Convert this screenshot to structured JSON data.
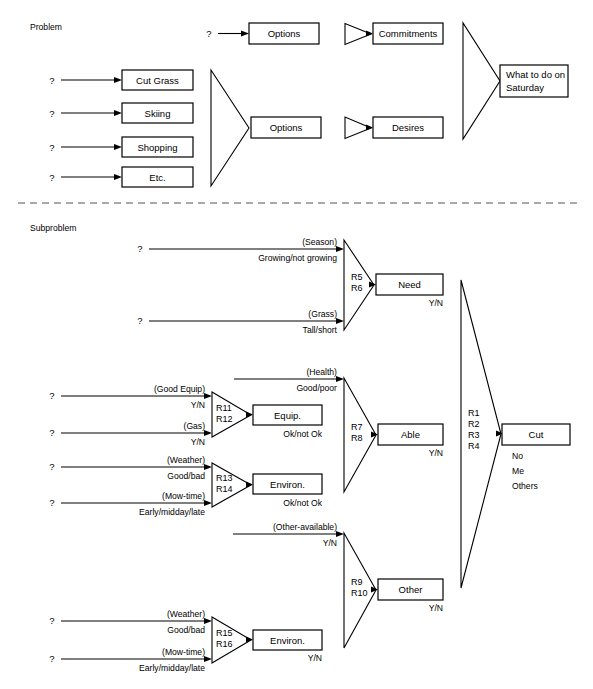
{
  "figure": {
    "sections": [
      {
        "id": "problem",
        "label": "Problem"
      },
      {
        "id": "subproblem",
        "label": "Subproblem"
      }
    ],
    "divider": "dashed-horizontal-separator"
  },
  "problem": {
    "label": "Problem",
    "unknown_marker": "?",
    "top_row": {
      "input_marker": "?",
      "options_box": "Options",
      "commitments_box": "Commitments"
    },
    "option_boxes": [
      {
        "marker": "?",
        "label": "Cut Grass"
      },
      {
        "marker": "?",
        "label": "Skiing"
      },
      {
        "marker": "?",
        "label": "Shopping"
      },
      {
        "marker": "?",
        "label": "Etc."
      }
    ],
    "bottom_row": {
      "options_box": "Options",
      "desires_box": "Desires"
    },
    "goal_box": {
      "line1": "What to do on",
      "line2": "Saturday"
    }
  },
  "subproblem": {
    "label": "Subproblem",
    "groups": [
      {
        "id": "need",
        "inputs": [
          {
            "marker": "?",
            "name": "(Season)",
            "values": "Growing/not growing"
          },
          {
            "marker": "?",
            "name": "(Grass)",
            "values": "Tall/short"
          }
        ],
        "rules": [
          "R5",
          "R6"
        ],
        "output_box": "Need",
        "output_values": "Y/N"
      },
      {
        "id": "equip",
        "inputs": [
          {
            "marker": "?",
            "name": "(Good Equip)",
            "values": "Y/N"
          },
          {
            "marker": "?",
            "name": "(Gas)",
            "values": "Y/N"
          }
        ],
        "rules": [
          "R11",
          "R12"
        ],
        "output_box": "Equip.",
        "output_values": "Ok/not Ok"
      },
      {
        "id": "environ-1",
        "inputs": [
          {
            "marker": "?",
            "name": "(Weather)",
            "values": "Good/bad"
          },
          {
            "marker": "?",
            "name": "(Mow-time)",
            "values": "Early/midday/late"
          }
        ],
        "rules": [
          "R13",
          "R14"
        ],
        "output_box": "Environ.",
        "output_values": "Ok/not Ok"
      },
      {
        "id": "able",
        "direct_input": {
          "name": "(Health)",
          "values": "Good/poor"
        },
        "rules": [
          "R7",
          "R8"
        ],
        "output_box": "Able",
        "output_values": "Y/N"
      },
      {
        "id": "other",
        "direct_input": {
          "name": "(Other-available)",
          "values": "Y/N"
        },
        "rules": [
          "R9",
          "R10"
        ],
        "output_box": "Other",
        "output_values": "Y/N"
      },
      {
        "id": "environ-2",
        "inputs": [
          {
            "marker": "?",
            "name": "(Weather)",
            "values": "Good/bad"
          },
          {
            "marker": "?",
            "name": "(Mow-time)",
            "values": "Early/midday/late"
          }
        ],
        "rules": [
          "R15",
          "R16"
        ],
        "output_box": "Environ.",
        "output_values": "Y/N"
      }
    ],
    "final": {
      "rules": [
        "R1",
        "R2",
        "R3",
        "R4"
      ],
      "output_box": "Cut",
      "output_values": [
        "No",
        "Me",
        "Others"
      ]
    }
  }
}
